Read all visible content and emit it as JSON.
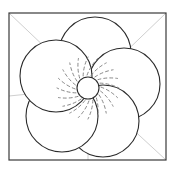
{
  "document": {
    "title": "Flower Line Drawing",
    "kind": "line-art-illustration",
    "subject": "five-petal flower",
    "background_color": "#ffffff"
  },
  "colors": {
    "outline": "#2b2b2b",
    "frame": "#3a3a3a",
    "guide_line": "#cfcfcf",
    "dashed_vein": "#7a7a7a",
    "page_background": "#ffffff",
    "petal_fill": "#ffffff"
  },
  "frame": {
    "name": "picture-frame",
    "x": 9,
    "y": 13,
    "width": 157,
    "height": 147,
    "stroke_width": 1.2
  },
  "guides": [
    {
      "name": "guide-diagonal-top-left",
      "x1": 9,
      "y1": 13,
      "x2": 88,
      "y2": 88
    },
    {
      "name": "guide-diagonal-top-right",
      "x1": 166,
      "y1": 13,
      "x2": 88,
      "y2": 88
    },
    {
      "name": "guide-diagonal-bottom-right",
      "x1": 166,
      "y1": 160,
      "x2": 88,
      "y2": 88
    },
    {
      "name": "guide-horizontal-left",
      "x1": 9,
      "y1": 96,
      "x2": 88,
      "y2": 88
    },
    {
      "name": "guide-vertical-bottom",
      "x1": 88,
      "y1": 160,
      "x2": 88,
      "y2": 88
    }
  ],
  "flower": {
    "name": "five-petal-flower",
    "center": {
      "x": 88,
      "y": 88
    },
    "center_circle": {
      "name": "flower-center",
      "cx": 88,
      "cy": 88,
      "r": 11,
      "label": "center disc"
    },
    "petal_count": 5,
    "petal_radius": 36,
    "petal_orbit_radius": 36,
    "petals": [
      {
        "name": "petal-top",
        "index": 0,
        "angle_deg": -78,
        "cx": 95,
        "cy": 53
      },
      {
        "name": "petal-right",
        "index": 1,
        "angle_deg": -6,
        "cx": 124,
        "cy": 84
      },
      {
        "name": "petal-bottom-right",
        "index": 2,
        "angle_deg": 66,
        "cx": 103,
        "cy": 121
      },
      {
        "name": "petal-bottom-left",
        "index": 3,
        "angle_deg": 138,
        "cx": 62,
        "cy": 116
      },
      {
        "name": "petal-left",
        "index": 4,
        "angle_deg": 210,
        "cx": 56,
        "cy": 76
      }
    ],
    "veins": {
      "name": "dashed-radiating-veins",
      "count": 20,
      "style": "curved dashed",
      "dash_pattern": "3 3",
      "inner_radius": 13,
      "outer_radius": 31,
      "curve_bias_deg": 22,
      "angles_deg": [
        -94,
        -76,
        -58,
        -40,
        -22,
        -4,
        14,
        32,
        50,
        68,
        86,
        104,
        122,
        140,
        158,
        176,
        194,
        212,
        230,
        248
      ]
    }
  }
}
